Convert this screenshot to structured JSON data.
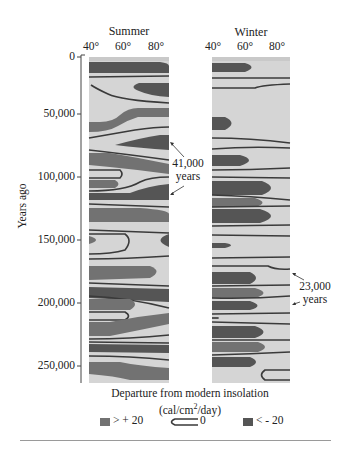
{
  "figure": {
    "panels": [
      {
        "id": "summer",
        "title": "Summer",
        "lat_ticks": [
          "40°",
          "60°",
          "80°"
        ]
      },
      {
        "id": "winter",
        "title": "Winter",
        "lat_ticks": [
          "40°",
          "60°",
          "80°"
        ]
      }
    ],
    "y_axis": {
      "title": "Years ago",
      "ticks": [
        {
          "value": 0,
          "label": "0"
        },
        {
          "value": 50000,
          "label": "50,000"
        },
        {
          "value": 100000,
          "label": "100,000"
        },
        {
          "value": 150000,
          "label": "150,000"
        },
        {
          "value": 200000,
          "label": "200,000"
        },
        {
          "value": 250000,
          "label": "250,000"
        }
      ],
      "range": [
        0,
        258000
      ]
    },
    "annotations": {
      "summer_cycle": {
        "line1": "41,000",
        "line2": "years"
      },
      "winter_cycle": {
        "line1": "23,000",
        "line2": "years"
      }
    },
    "x_label": {
      "line1": "Departure from modern insolation",
      "line2_pre": "(cal/cm",
      "line2_sup": "2",
      "line2_post": "/day)"
    },
    "legend": [
      {
        "key": "warm",
        "label": "> + 20",
        "color": "#727272"
      },
      {
        "key": "zero",
        "label": "0",
        "color": "#3a3a3a"
      },
      {
        "key": "cold",
        "label": "< - 20",
        "color": "#555555"
      }
    ],
    "colors": {
      "background": "#d5d5d5",
      "warm": "#727272",
      "cold": "#555555",
      "contour": "#3a3a3a"
    }
  }
}
